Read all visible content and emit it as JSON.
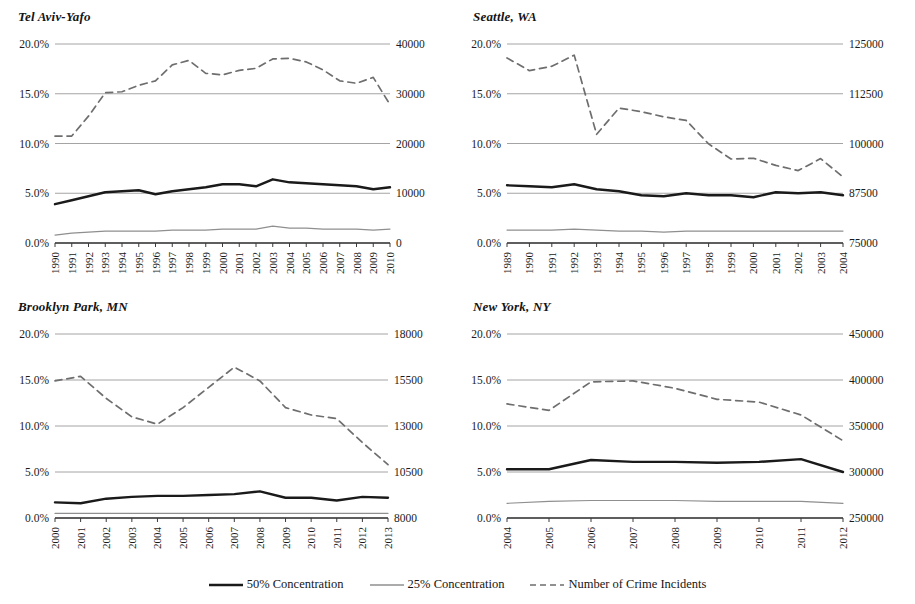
{
  "legend": {
    "items": [
      {
        "label": "50% Concentration",
        "style": "solid-thick",
        "color": "#1a1a1a"
      },
      {
        "label": "25% Concentration",
        "style": "solid-thin",
        "color": "#8a8a8a"
      },
      {
        "label": "Number of Crime Incidents",
        "style": "dashed",
        "color": "#6e6e6e"
      }
    ]
  },
  "colors": {
    "series_50": "#1a1a1a",
    "series_25": "#8f8f8f",
    "series_crime": "#6e6e6e",
    "gridline": "#9a9a9a",
    "axis": "#3a3a3a",
    "text": "#1b1b1b"
  },
  "chart_data": [
    {
      "type": "line",
      "title": "Tel Aviv-Yafo",
      "xlabel": "",
      "ylabel": "",
      "grid": true,
      "legend_position": "bottom",
      "categories": [
        "1990",
        "1991",
        "1992",
        "1993",
        "1994",
        "1995",
        "1996",
        "1997",
        "1998",
        "1999",
        "2000",
        "2001",
        "2002",
        "2003",
        "2004",
        "2005",
        "2006",
        "2007",
        "2008",
        "2009",
        "2010"
      ],
      "left_axis": {
        "ticks": [
          "0.0%",
          "5.0%",
          "10.0%",
          "15.0%",
          "20.0%"
        ],
        "min": 0,
        "max": 20,
        "unit": "%"
      },
      "right_axis": {
        "ticks": [
          "0",
          "10000",
          "20000",
          "30000",
          "40000"
        ],
        "min": 0,
        "max": 40000
      },
      "series": [
        {
          "name": "50% Concentration",
          "axis": "left",
          "style": "solid-thick",
          "values": [
            3.9,
            4.3,
            4.7,
            5.1,
            5.2,
            5.3,
            4.9,
            5.2,
            5.4,
            5.6,
            5.9,
            5.9,
            5.7,
            6.4,
            6.1,
            6.0,
            5.9,
            5.8,
            5.7,
            5.4,
            5.6
          ]
        },
        {
          "name": "25% Concentration",
          "axis": "left",
          "style": "solid-thin",
          "values": [
            0.8,
            1.0,
            1.1,
            1.2,
            1.2,
            1.2,
            1.2,
            1.3,
            1.3,
            1.3,
            1.4,
            1.4,
            1.4,
            1.7,
            1.5,
            1.5,
            1.4,
            1.4,
            1.4,
            1.3,
            1.4
          ]
        },
        {
          "name": "Number of Crime Incidents",
          "axis": "right",
          "style": "dashed",
          "values": [
            21500,
            21500,
            25500,
            30200,
            30400,
            31700,
            32600,
            35800,
            36700,
            34100,
            33800,
            34700,
            35100,
            37000,
            37100,
            36400,
            34800,
            32600,
            32100,
            33300,
            27800
          ]
        }
      ]
    },
    {
      "type": "line",
      "title": "Seattle, WA",
      "xlabel": "",
      "ylabel": "",
      "grid": true,
      "legend_position": "bottom",
      "categories": [
        "1989",
        "1990",
        "1991",
        "1992",
        "1993",
        "1994",
        "1995",
        "1996",
        "1997",
        "1998",
        "1999",
        "2000",
        "2001",
        "2002",
        "2003",
        "2004"
      ],
      "left_axis": {
        "ticks": [
          "0.0%",
          "5.0%",
          "10.0%",
          "15.0%",
          "20.0%"
        ],
        "min": 0,
        "max": 20,
        "unit": "%"
      },
      "right_axis": {
        "ticks": [
          "75000",
          "87500",
          "100000",
          "112500",
          "125000"
        ],
        "min": 75000,
        "max": 125000
      },
      "series": [
        {
          "name": "50% Concentration",
          "axis": "left",
          "style": "solid-thick",
          "values": [
            5.8,
            5.7,
            5.6,
            5.9,
            5.4,
            5.2,
            4.8,
            4.7,
            5.0,
            4.8,
            4.8,
            4.6,
            5.1,
            5.0,
            5.1,
            4.8
          ]
        },
        {
          "name": "25% Concentration",
          "axis": "left",
          "style": "solid-thin",
          "values": [
            1.3,
            1.3,
            1.3,
            1.4,
            1.3,
            1.2,
            1.2,
            1.1,
            1.2,
            1.2,
            1.2,
            1.2,
            1.2,
            1.2,
            1.2,
            1.2
          ]
        },
        {
          "name": "Number of Crime Incidents",
          "axis": "right",
          "style": "dashed",
          "values": [
            121500,
            118300,
            119400,
            122200,
            102300,
            108900,
            108000,
            106700,
            105800,
            99900,
            96100,
            96300,
            94500,
            93200,
            96200,
            91600
          ]
        }
      ]
    },
    {
      "type": "line",
      "title": "Brooklyn Park, MN",
      "xlabel": "",
      "ylabel": "",
      "grid": true,
      "legend_position": "bottom",
      "categories": [
        "2000",
        "2001",
        "2002",
        "2003",
        "2004",
        "2005",
        "2006",
        "2007",
        "2008",
        "2009",
        "2010",
        "2011",
        "2012",
        "2013"
      ],
      "left_axis": {
        "ticks": [
          "0.0%",
          "5.0%",
          "10.0%",
          "15.0%",
          "20.0%"
        ],
        "min": 0,
        "max": 20,
        "unit": "%"
      },
      "right_axis": {
        "ticks": [
          "8000",
          "10500",
          "13000",
          "15500",
          "18000"
        ],
        "min": 8000,
        "max": 18000
      },
      "series": [
        {
          "name": "50% Concentration",
          "axis": "left",
          "style": "solid-thick",
          "values": [
            1.7,
            1.6,
            2.1,
            2.3,
            2.4,
            2.4,
            2.5,
            2.6,
            2.9,
            2.2,
            2.2,
            1.9,
            2.3,
            2.2
          ]
        },
        {
          "name": "25% Concentration",
          "axis": "left",
          "style": "solid-thin",
          "values": [
            0.5,
            0.5,
            0.5,
            0.5,
            0.5,
            0.5,
            0.5,
            0.5,
            0.5,
            0.5,
            0.5,
            0.5,
            0.5,
            0.5
          ]
        },
        {
          "name": "Number of Crime Incidents",
          "axis": "right",
          "style": "dashed",
          "values": [
            15450,
            15700,
            14500,
            13500,
            13100,
            14000,
            15100,
            16200,
            15450,
            14000,
            13600,
            13400,
            12100,
            10900
          ]
        }
      ]
    },
    {
      "type": "line",
      "title": "New York, NY",
      "xlabel": "",
      "ylabel": "",
      "grid": true,
      "legend_position": "bottom",
      "categories": [
        "2004",
        "2005",
        "2006",
        "2007",
        "2008",
        "2009",
        "2010",
        "2011",
        "2012"
      ],
      "left_axis": {
        "ticks": [
          "0.0%",
          "5.0%",
          "10.0%",
          "15.0%",
          "20.0%"
        ],
        "min": 0,
        "max": 20,
        "unit": "%"
      },
      "right_axis": {
        "ticks": [
          "250000",
          "300000",
          "350000",
          "400000",
          "450000"
        ],
        "min": 250000,
        "max": 450000
      },
      "series": [
        {
          "name": "50% Concentration",
          "axis": "left",
          "style": "solid-thick",
          "values": [
            5.3,
            5.3,
            6.3,
            6.1,
            6.1,
            6.0,
            6.1,
            6.4,
            5.0
          ]
        },
        {
          "name": "25% Concentration",
          "axis": "left",
          "style": "solid-thin",
          "values": [
            1.6,
            1.8,
            1.9,
            1.9,
            1.9,
            1.8,
            1.8,
            1.8,
            1.6
          ]
        },
        {
          "name": "Number of Crime Incidents",
          "axis": "right",
          "style": "dashed",
          "values": [
            374000,
            367000,
            398000,
            399000,
            391000,
            379000,
            376000,
            362000,
            334000
          ]
        }
      ]
    }
  ]
}
